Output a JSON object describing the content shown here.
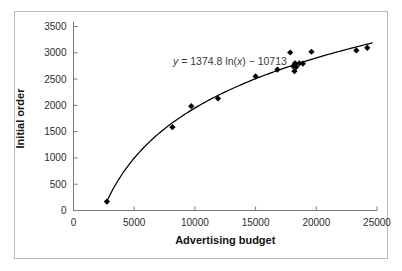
{
  "figure": {
    "border_color": "#b9b9b9",
    "background": "#ffffff",
    "marker_color": "#000000",
    "curve_color": "#000000",
    "axis_color": "#7a7a7a"
  },
  "chart_data": {
    "type": "scatter",
    "title": "",
    "xlabel": "Advertising budget",
    "ylabel": "Initial order",
    "xlim": [
      0,
      25000
    ],
    "ylim": [
      0,
      3500
    ],
    "xticks": [
      0,
      5000,
      10000,
      15000,
      20000,
      25000
    ],
    "yticks": [
      0,
      500,
      1000,
      1500,
      2000,
      2500,
      3000,
      3500
    ],
    "xtick_labels": [
      "0",
      "5000",
      "10000",
      "15000",
      "20000",
      "25000"
    ],
    "ytick_labels": [
      "0",
      "500",
      "1000",
      "1500",
      "2000",
      "2500",
      "3000",
      "3500"
    ],
    "grid": false,
    "legend": false,
    "annotations": [
      {
        "name": "trendline-equation",
        "text": "y = 1374.8 ln(x) − 10713",
        "parts": {
          "y": "y",
          "equals": " = 1374.8 ln(",
          "x": "x",
          "tail": ") − 10713"
        },
        "x": 8200,
        "y": 2770
      }
    ],
    "series": [
      {
        "name": "Observations",
        "marker": "diamond",
        "color": "#000000",
        "points": [
          [
            2750,
            170
          ],
          [
            8150,
            1585
          ],
          [
            9700,
            1985
          ],
          [
            11900,
            2130
          ],
          [
            15000,
            2550
          ],
          [
            16800,
            2680
          ],
          [
            17850,
            3005
          ],
          [
            18100,
            2745
          ],
          [
            18200,
            2650
          ],
          [
            18250,
            2800
          ],
          [
            18350,
            2730
          ],
          [
            18600,
            2800
          ],
          [
            18900,
            2795
          ],
          [
            19600,
            3020
          ],
          [
            23300,
            3045
          ],
          [
            24200,
            3095
          ]
        ]
      }
    ],
    "fit": {
      "name": "Logarithmic trendline",
      "type": "logarithmic",
      "equation": "y = 1374.8 ln(x) - 10713",
      "coefficient": 1374.8,
      "intercept": -10713,
      "color": "#000000",
      "xrange": [
        2700,
        24600
      ]
    }
  }
}
